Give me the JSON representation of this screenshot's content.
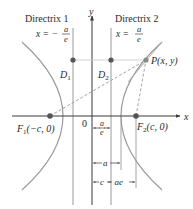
{
  "figure": {
    "type": "hyperbola-directrices",
    "axes": {
      "x_label": "x",
      "y_label": "y",
      "origin_label": "0"
    },
    "directrix_1": {
      "title": "Directrix 1",
      "equation_lhs": "x = −",
      "num": "a",
      "den": "e"
    },
    "directrix_2": {
      "title": "Directrix 2",
      "equation_lhs": "x =",
      "num": "a",
      "den": "e"
    },
    "points": {
      "D1": {
        "label": "D",
        "sub": "1"
      },
      "D2": {
        "label": "D",
        "sub": "2"
      },
      "P": {
        "label": "P(x, y)"
      },
      "F1": {
        "label": "F",
        "sub": "1",
        "coords": "(−c, 0)"
      },
      "F2": {
        "label": "F",
        "sub": "2",
        "coords": "(c, 0)"
      }
    },
    "dimensions": {
      "a_over_e": {
        "num": "a",
        "den": "e"
      },
      "a": "a",
      "c": "c = ae"
    },
    "colors": {
      "curve": "#9a9a9a",
      "axis": "#3a3a3a",
      "point": "#555555",
      "dashed": "#9a9a9a",
      "text": "#2a2a2a"
    }
  }
}
